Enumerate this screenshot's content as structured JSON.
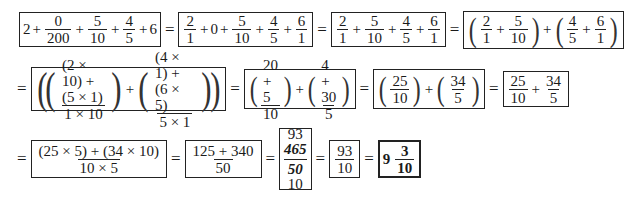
{
  "row1": {
    "expr1": {
      "a": "2",
      "op1": "+",
      "f1": {
        "n": "0",
        "d": "200"
      },
      "op2": "+",
      "f2": {
        "n": "5",
        "d": "10"
      },
      "op3": "+",
      "f3": {
        "n": "4",
        "d": "5"
      },
      "op4": "+",
      "b": "6"
    },
    "eq": "=",
    "expr2": {
      "f1": {
        "n": "2",
        "d": "1"
      },
      "op1": "+",
      "b": "0",
      "op2": "+",
      "f2": {
        "n": "5",
        "d": "10"
      },
      "op3": "+",
      "f3": {
        "n": "4",
        "d": "5"
      },
      "op4": "+",
      "f4": {
        "n": "6",
        "d": "1"
      }
    },
    "expr3": {
      "f1": {
        "n": "2",
        "d": "1"
      },
      "op1": "+",
      "f2": {
        "n": "5",
        "d": "10"
      },
      "op2": "+",
      "f3": {
        "n": "4",
        "d": "5"
      },
      "op3": "+",
      "f4": {
        "n": "6",
        "d": "1"
      }
    },
    "expr4": {
      "f1": {
        "n": "2",
        "d": "1"
      },
      "op1": "+",
      "f2": {
        "n": "5",
        "d": "10"
      },
      "op2": "+",
      "f3": {
        "n": "4",
        "d": "5"
      },
      "op3": "+",
      "f4": {
        "n": "6",
        "d": "1"
      }
    }
  },
  "row2": {
    "eq": "=",
    "expr1": {
      "f1": {
        "n": "(2 × 10) + (5 × 1)",
        "d": "1 × 10"
      },
      "op": "+",
      "f2": {
        "n": "(4 × 1) + (6 × 5)",
        "d": "5 × 1"
      }
    },
    "expr2": {
      "f1": {
        "n": "20 + 5",
        "d": "10"
      },
      "op": "+",
      "f2": {
        "n": "4 + 30",
        "d": "5"
      }
    },
    "expr3": {
      "f1": {
        "n": "25",
        "d": "10"
      },
      "op": "+",
      "f2": {
        "n": "34",
        "d": "5"
      }
    },
    "expr4": {
      "f1": {
        "n": "25",
        "d": "10"
      },
      "op": "+",
      "f2": {
        "n": "34",
        "d": "5"
      }
    }
  },
  "row3": {
    "eq": "=",
    "expr1": {
      "n": "(25 × 5) + (34 × 10)",
      "d": "10 × 5"
    },
    "expr2": {
      "n": "125 + 340",
      "d": "50"
    },
    "expr3": {
      "top": "93",
      "n": "465",
      "d": "50",
      "bottom": "10"
    },
    "expr4": {
      "n": "93",
      "d": "10"
    },
    "expr5": {
      "whole": "9",
      "n": "3",
      "d": "10"
    }
  }
}
